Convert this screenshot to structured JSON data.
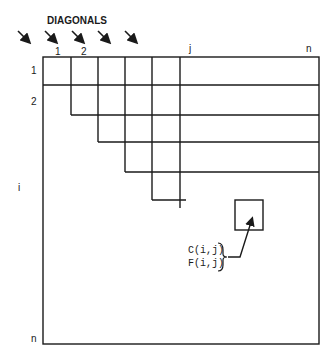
{
  "title": "DIAGONALS",
  "diagonal_labels": [
    "1",
    "2"
  ],
  "column_labels": {
    "j": "j",
    "n": "n"
  },
  "row_labels": {
    "r1": "1",
    "r2": "2",
    "i": "i",
    "n": "n"
  },
  "cell_labels": [
    "C(i,j)",
    "F(i,j)"
  ],
  "colors": {
    "ink": "#1a1a1a",
    "background": "#ffffff"
  },
  "arrow_count": 5
}
